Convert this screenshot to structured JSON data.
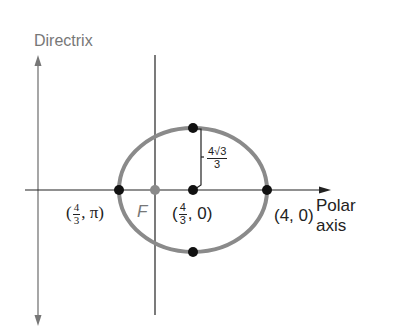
{
  "labels": {
    "directrix": "Directrix",
    "polar_axis_line1": "Polar",
    "polar_axis_line2": "axis",
    "focus": "F",
    "vertex_left": {
      "open": "(",
      "num": "4",
      "den": "3",
      "rest": ", π)"
    },
    "center": {
      "open": "(",
      "num": "4",
      "den": "3",
      "rest": ", 0)"
    },
    "vertex_right": "(4, 0)",
    "semi_minor": {
      "num": "4√3",
      "den": "3"
    }
  },
  "colors": {
    "ellipse": "#8a8a8a",
    "axis": "#222222",
    "directrix": "#777777",
    "focus_point": "#8a8a8a",
    "points": "#111111"
  }
}
